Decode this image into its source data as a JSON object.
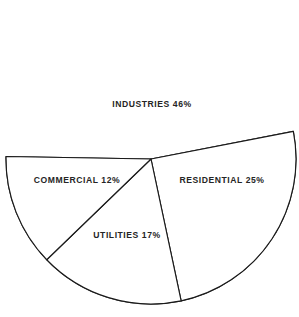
{
  "chart_data": {
    "type": "pie",
    "title": "",
    "subtitle": "",
    "xlabel": "",
    "ylabel": "",
    "legend_position": "none",
    "grid": false,
    "units": "percent",
    "categories": [
      "INDUSTRIES",
      "RESIDENTIAL",
      "UTILITIES",
      "COMMERCIAL"
    ],
    "values": [
      46,
      25,
      17,
      12
    ],
    "slices": [
      {
        "name": "INDUSTRIES",
        "label": "INDUSTRIES 46%",
        "value": 46,
        "value_text": "46%",
        "fill": "#ffffff",
        "stroke": "#1a1a1a",
        "start_angle_deg": -11,
        "end_angle_deg": 181,
        "label_x": 152,
        "label_y": 104
      },
      {
        "name": "RESIDENTIAL",
        "label": "RESIDENTIAL 25%",
        "value": 25,
        "value_text": "25%",
        "fill": "#ffffff",
        "stroke": "#1a1a1a",
        "start_angle_deg": -11,
        "end_angle_deg": 78,
        "label_x": 222,
        "label_y": 180
      },
      {
        "name": "UTILITIES",
        "label": "UTILITIES 17%",
        "value": 17,
        "value_text": "17%",
        "fill": "#ffffff",
        "stroke": "#1a1a1a",
        "start_angle_deg": 78,
        "end_angle_deg": 136,
        "label_x": 127,
        "label_y": 235
      },
      {
        "name": "COMMERCIAL",
        "label": "COMMERCIAL 12%",
        "value": 12,
        "value_text": "12%",
        "fill": "#ffffff",
        "stroke": "#1a1a1a",
        "start_angle_deg": 136,
        "end_angle_deg": 181,
        "label_x": 77,
        "label_y": 180
      }
    ],
    "geometry": {
      "center_x": 151,
      "center_y": 159,
      "radius": 145
    },
    "colors": {
      "background": "#ffffff",
      "outline": "#1a1a1a",
      "text": "#252525"
    }
  }
}
